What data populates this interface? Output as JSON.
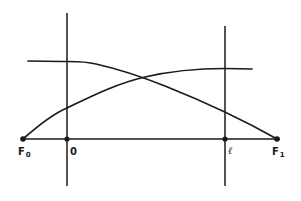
{
  "diagram": {
    "type": "line-drawing",
    "stroke_color": "#1a1a1a",
    "background_color": "#ffffff",
    "axis": {
      "name": "horizontal-axis",
      "y": 139,
      "x_start": 22,
      "x_end": 280
    },
    "vertical_lines": [
      {
        "name": "left-vertical-line-origin",
        "x": 67,
        "y_top": 13,
        "y_bottom": 186
      },
      {
        "name": "right-vertical-line-l",
        "x": 225,
        "y_top": 26,
        "y_bottom": 186
      }
    ],
    "points": [
      {
        "id": "F0",
        "x": 23,
        "y": 139
      },
      {
        "id": "O",
        "x": 67,
        "y": 139
      },
      {
        "id": "l",
        "x": 225,
        "y": 139
      },
      {
        "id": "F1",
        "x": 277,
        "y": 139
      }
    ],
    "curves": [
      {
        "name": "decreasing-curve",
        "description": "flat plateau at left, then descends to F1",
        "path": "M28,61 L62,61.5 C74,61.5 84,61 96,64 C118,69 140,76 165,86 C200,100 240,118 277,139"
      },
      {
        "name": "increasing-curve",
        "description": "rises from F0, flattens to plateau at right",
        "path": "M23,139 C40,124 55,113 67,108 C90,97 115,84 145,77 C175,70 200,68.5 225,68.5 L252,69"
      }
    ],
    "crossing_point": {
      "x": 145,
      "y": 77
    }
  },
  "labels": {
    "F0": {
      "main": "F",
      "sub": "0"
    },
    "O": {
      "main": "0"
    },
    "l": {
      "main": "ℓ"
    },
    "F1": {
      "main": "F",
      "sub": "1"
    }
  }
}
